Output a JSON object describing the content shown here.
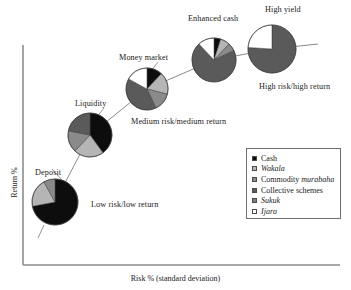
{
  "axes": {
    "x_label": "Risk % (standard deviation)",
    "y_label": "Return %"
  },
  "legend": {
    "items": [
      {
        "label": "Cash",
        "italic": false,
        "color": "#0d0d0d"
      },
      {
        "label": "Wakala",
        "italic": true,
        "color": "#b5b5b5"
      },
      {
        "label": "Commodity murabaha",
        "italic_part": "murabaha",
        "plain_part": "Commodity ",
        "italic": false,
        "color": "#8a8a8a"
      },
      {
        "label": "Collective schemes",
        "italic": false,
        "color": "#5a5a5a"
      },
      {
        "label": "Sukuk",
        "italic": true,
        "color": "#7d7d7d"
      },
      {
        "label": "Ijara",
        "italic": true,
        "color": "#ffffff"
      }
    ]
  },
  "annotations": [
    {
      "name": "deposit",
      "text": "Deposit"
    },
    {
      "name": "liquidity",
      "text": "Liquidity"
    },
    {
      "name": "money-market",
      "text": "Money market"
    },
    {
      "name": "enhanced-cash",
      "text": "Enhanced cash"
    },
    {
      "name": "high-yield",
      "text": "High yield"
    },
    {
      "name": "low-risk-low-return",
      "text": "Low risk/low return"
    },
    {
      "name": "medium-risk-medium-return",
      "text": "Medium risk/medium return"
    },
    {
      "name": "high-risk-high-return",
      "text": "High risk/high return"
    }
  ],
  "chart_data": {
    "type": "pie",
    "title": "",
    "xlabel": "Risk % (standard deviation)",
    "ylabel": "Return %",
    "grid": false,
    "legend_position": "bottom-right",
    "categories": [
      "Cash",
      "Wakala",
      "Commodity murabaha",
      "Collective schemes",
      "Sukuk",
      "Ijara"
    ],
    "category_colors": [
      "#0d0d0d",
      "#b5b5b5",
      "#8a8a8a",
      "#5a5a5a",
      "#7d7d7d",
      "#ffffff"
    ],
    "pies": [
      {
        "name": "Deposit",
        "risk_position": 0.12,
        "return_position": 0.18,
        "radius_px": 23,
        "cx": 55,
        "cy": 202,
        "values": [
          72,
          20,
          8,
          0,
          0,
          0
        ]
      },
      {
        "name": "Liquidity",
        "risk_position": 0.29,
        "return_position": 0.43,
        "radius_px": 22,
        "cx": 90,
        "cy": 135,
        "values": [
          40,
          22,
          16,
          22,
          0,
          0
        ]
      },
      {
        "name": "Money market",
        "risk_position": 0.46,
        "return_position": 0.62,
        "radius_px": 21,
        "cx": 147,
        "cy": 89,
        "values": [
          12,
          17,
          14,
          40,
          0,
          17
        ]
      },
      {
        "name": "Enhanced cash",
        "risk_position": 0.66,
        "return_position": 0.76,
        "radius_px": 22,
        "cx": 214,
        "cy": 60,
        "values": [
          5,
          7,
          6,
          70,
          0,
          12
        ]
      },
      {
        "name": "High yield",
        "risk_position": 0.85,
        "return_position": 0.86,
        "radius_px": 24,
        "cx": 272,
        "cy": 49,
        "values": [
          0,
          0,
          0,
          76,
          0,
          24
        ]
      }
    ]
  }
}
